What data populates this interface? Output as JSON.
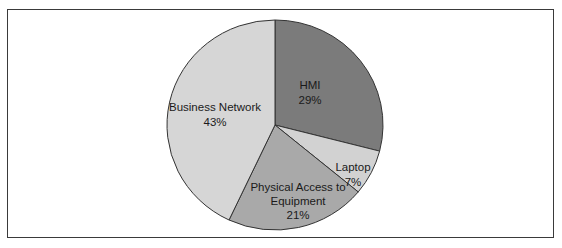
{
  "chart_data": {
    "type": "pie",
    "title": "",
    "start_angle_deg": 0,
    "direction": "clockwise",
    "legend": "none (data labels on slices)",
    "slices": [
      {
        "label": "HMI",
        "value": 29,
        "display": "29%",
        "color": "#7b7b7b"
      },
      {
        "label": "Laptop",
        "value": 7,
        "display": "7%",
        "color": "#d2d2d2"
      },
      {
        "label": "Physical Access to Equipment",
        "display_lines": [
          "Physical Access to",
          "Equipment"
        ],
        "value": 21,
        "display": "21%",
        "color": "#a9a9a9"
      },
      {
        "label": "Business Network",
        "value": 43,
        "display": "43%",
        "color": "#d6d6d6"
      }
    ]
  },
  "labels": {
    "hmi": {
      "name": "HMI",
      "pct": "29%"
    },
    "laptop": {
      "name": "Laptop",
      "pct": "7%"
    },
    "physical": {
      "line1": "Physical Access to",
      "line2": "Equipment",
      "pct": "21%"
    },
    "business": {
      "name": "Business Network",
      "pct": "43%"
    }
  }
}
